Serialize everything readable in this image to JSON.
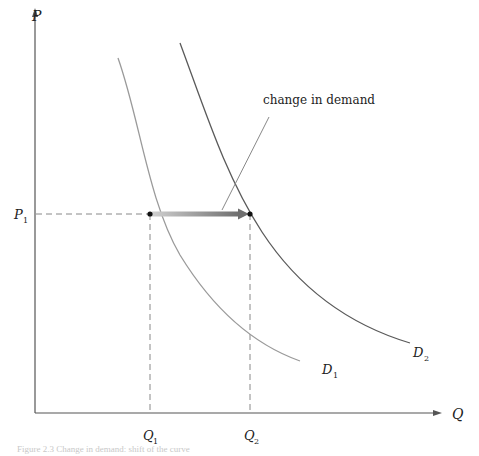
{
  "diagram": {
    "type": "supply-demand-shift",
    "axes": {
      "y_label": "P",
      "x_label": "Q"
    },
    "price_level": {
      "label": "P",
      "subscript": "1"
    },
    "quantities": [
      {
        "label": "Q",
        "subscript": "1"
      },
      {
        "label": "Q",
        "subscript": "2"
      }
    ],
    "curves": [
      {
        "name": "D",
        "subscript": "1",
        "color": "#9a9a9a"
      },
      {
        "name": "D",
        "subscript": "2",
        "color": "#5a5a5a"
      }
    ],
    "annotation": "change in demand",
    "arrow": {
      "from": "Q1",
      "to": "Q2",
      "color": "#7a7a7a"
    },
    "caption": "Figure 2.3   Change in demand: shift of the curve"
  },
  "colors": {
    "axis": "#555555",
    "dashed": "#888888",
    "point": "#111111"
  }
}
